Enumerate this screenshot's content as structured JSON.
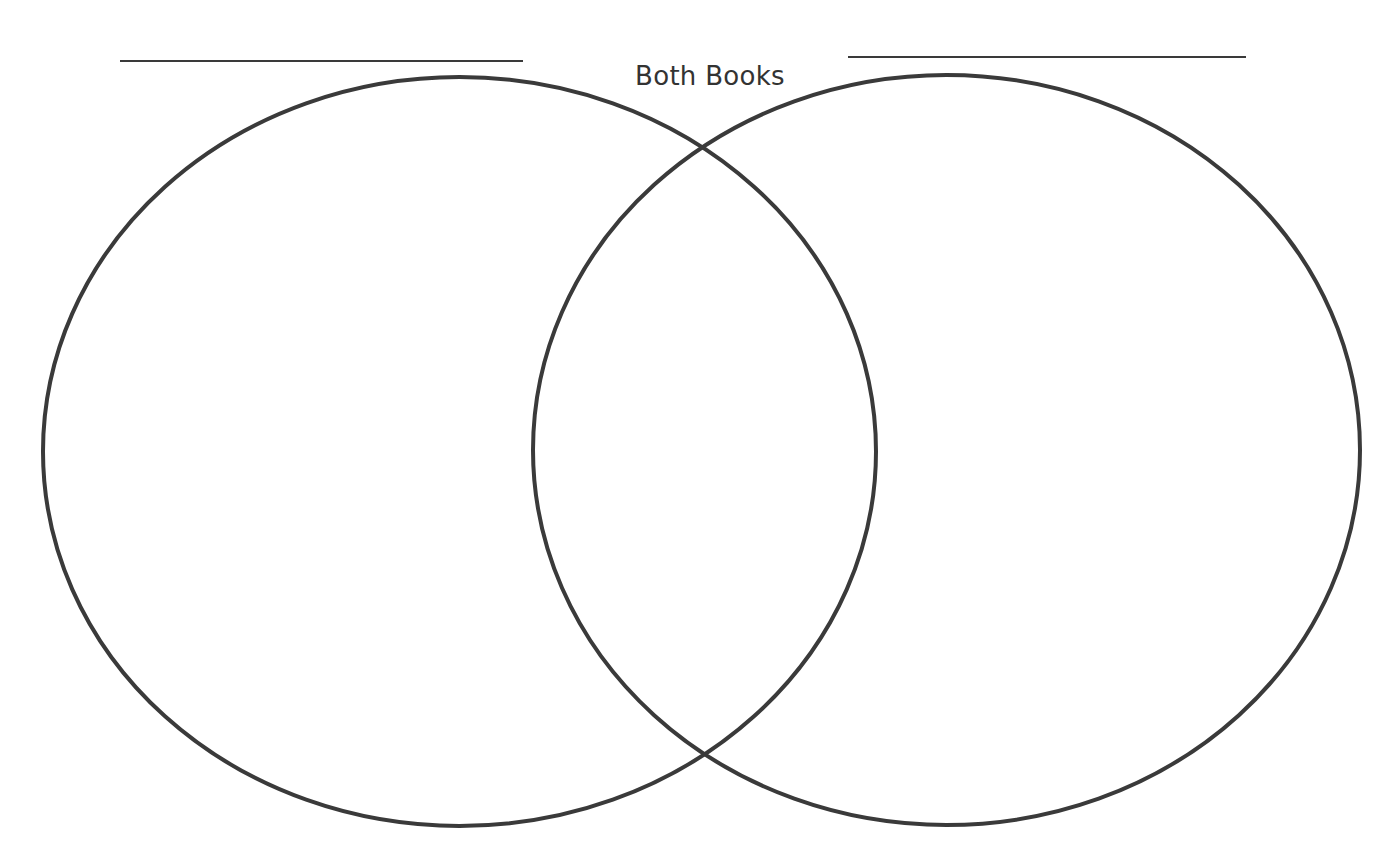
{
  "diagram": {
    "type": "venn",
    "center_label": "Both Books",
    "left_set": {
      "label": "",
      "title_line": "blank line for book title"
    },
    "right_set": {
      "label": "",
      "title_line": "blank line for book title"
    },
    "stroke_color": "#3a3a3a",
    "background_color": "#ffffff"
  }
}
